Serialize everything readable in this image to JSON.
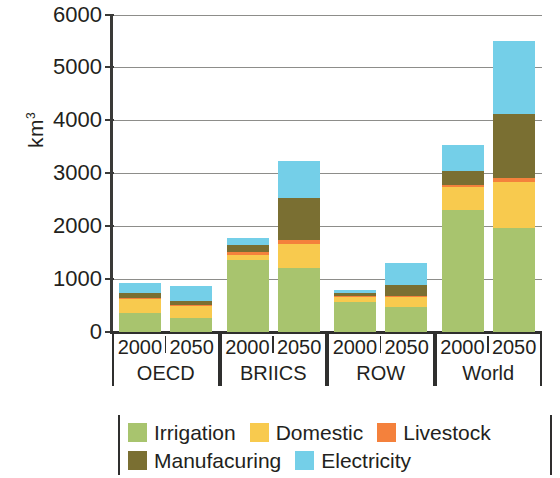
{
  "chart_data": {
    "type": "bar",
    "subtype": "stacked",
    "title": "",
    "xlabel": "",
    "ylabel": "km3",
    "ylabel_display": "km",
    "ylabel_superscript": "3",
    "ylim": [
      0,
      6000
    ],
    "ytick_labels": [
      "6000",
      "5000",
      "4000",
      "3000",
      "2000",
      "1000",
      "0"
    ],
    "ytick_values": [
      6000,
      5000,
      4000,
      3000,
      2000,
      1000,
      0
    ],
    "grid": true,
    "legend_position": "bottom",
    "groups": [
      "OECD",
      "BRIICS",
      "ROW",
      "World"
    ],
    "categories": [
      "OECD 2000",
      "OECD 2050",
      "BRIICS 2000",
      "BRIICS 2050",
      "ROW 2000",
      "ROW 2050",
      "World 2000",
      "World 2050"
    ],
    "group_years": [
      "2000",
      "2050"
    ],
    "series": [
      {
        "name": "Irrigation",
        "color": "#a8c46e",
        "values": [
          360,
          265,
          1365,
          1210,
          570,
          475,
          2310,
          1970
        ]
      },
      {
        "name": "Domestic",
        "color": "#f8ca4e",
        "values": [
          265,
          230,
          95,
          455,
          95,
          180,
          435,
          870
        ]
      },
      {
        "name": "Livestock",
        "color": "#f4813c",
        "values": [
          25,
          25,
          55,
          75,
          25,
          30,
          45,
          70
        ]
      },
      {
        "name": "Manufacturing",
        "color": "#7a6f32",
        "values": [
          80,
          75,
          130,
          795,
          40,
          210,
          265,
          1210
        ]
      },
      {
        "name": "Electricity",
        "color": "#74cfe8",
        "values": [
          200,
          280,
          135,
          700,
          70,
          420,
          485,
          1385
        ]
      }
    ],
    "totals": [
      930,
      875,
      1780,
      3235,
      800,
      1315,
      3540,
      5505
    ]
  },
  "legend": {
    "entries": [
      {
        "label": "Irrigation",
        "swatch": "irrigation"
      },
      {
        "label": "Domestic",
        "swatch": "domestic"
      },
      {
        "label": "Livestock",
        "swatch": "livestock"
      },
      {
        "label": "Manufacuring",
        "swatch": "manufacturing"
      },
      {
        "label": "Electricity",
        "swatch": "electricity"
      }
    ]
  }
}
